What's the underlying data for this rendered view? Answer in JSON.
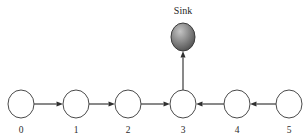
{
  "diagram": {
    "title_text": "Sink",
    "background_color": "#ffffff",
    "node_stroke_color": "#4a4a4a",
    "edge_color": "#4a4a4a",
    "arrow_color": "#303030",
    "sink_fill_light": "#b9b9b9",
    "sink_fill_dark": "#4f4f4f",
    "node_fill_color": "#ffffff",
    "type": "directed-graph",
    "sink": {
      "label": "Sink",
      "cx": 183,
      "cy": 37,
      "rx": 12,
      "ry": 14,
      "label_x": 183,
      "label_y": 14
    },
    "nodes": [
      {
        "id": "0",
        "label": "0",
        "cx": 21,
        "cy": 104,
        "rx": 13,
        "ry": 14,
        "label_x": 21,
        "label_y": 133
      },
      {
        "id": "1",
        "label": "1",
        "cx": 76,
        "cy": 104,
        "rx": 13,
        "ry": 14,
        "label_x": 76,
        "label_y": 133
      },
      {
        "id": "2",
        "label": "2",
        "cx": 128,
        "cy": 104,
        "rx": 13,
        "ry": 14,
        "label_x": 128,
        "label_y": 133
      },
      {
        "id": "3",
        "label": "3",
        "cx": 183,
        "cy": 104,
        "rx": 13,
        "ry": 14,
        "label_x": 183,
        "label_y": 133
      },
      {
        "id": "4",
        "label": "4",
        "cx": 237,
        "cy": 104,
        "rx": 13,
        "ry": 14,
        "label_x": 237,
        "label_y": 133
      },
      {
        "id": "5",
        "label": "5",
        "cx": 289,
        "cy": 104,
        "rx": 13,
        "ry": 14,
        "label_x": 289,
        "label_y": 133
      }
    ],
    "edges": [
      {
        "id": "edge-0-1",
        "from": "0",
        "to": "1",
        "direction": "right",
        "x1": 34,
        "y1": 104,
        "x2": 63,
        "y2": 104
      },
      {
        "id": "edge-1-2",
        "from": "1",
        "to": "2",
        "direction": "right",
        "x1": 89,
        "y1": 104,
        "x2": 115,
        "y2": 104
      },
      {
        "id": "edge-2-3",
        "from": "2",
        "to": "3",
        "direction": "right",
        "x1": 141,
        "y1": 104,
        "x2": 170,
        "y2": 104
      },
      {
        "id": "edge-4-3",
        "from": "4",
        "to": "3",
        "direction": "left",
        "x1": 224,
        "y1": 104,
        "x2": 196,
        "y2": 104
      },
      {
        "id": "edge-5-4",
        "from": "5",
        "to": "4",
        "direction": "left",
        "x1": 276,
        "y1": 104,
        "x2": 250,
        "y2": 104
      },
      {
        "id": "edge-3-sink",
        "from": "3",
        "to": "Sink",
        "direction": "up",
        "x1": 183,
        "y1": 90,
        "x2": 183,
        "y2": 51
      }
    ]
  }
}
